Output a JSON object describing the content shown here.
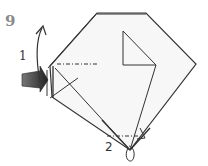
{
  "diagram": {
    "step_number": "9",
    "labels": {
      "first": "1",
      "second": "2"
    },
    "colors": {
      "line": "#333333",
      "paper": "#f7f7f7",
      "arrow_fill_dark": "#3a3a3a",
      "step_number": "#8a8a8a"
    }
  }
}
